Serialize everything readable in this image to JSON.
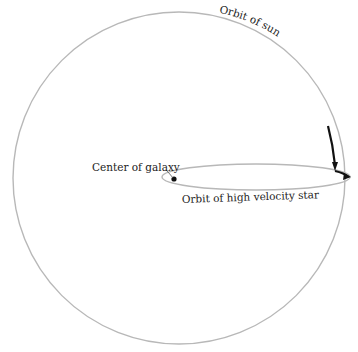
{
  "diagram": {
    "labels": {
      "sun_orbit": "Orbit of sun",
      "center": "Center of galaxy",
      "star_orbit": "Orbit of high velocity star"
    },
    "colors": {
      "orbit_line": "#b8b8b8",
      "arrow": "#111111",
      "text": "#222222"
    }
  }
}
